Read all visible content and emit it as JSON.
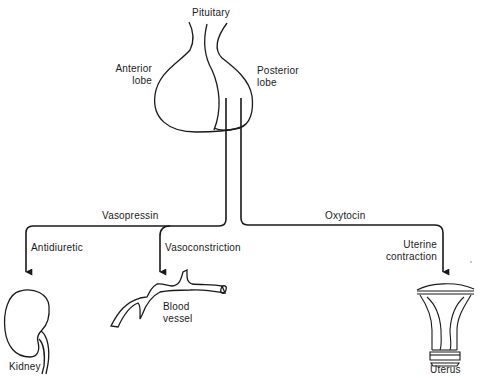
{
  "diagram": {
    "gland": {
      "title": "Pituitary",
      "anterior_label_line1": "Anterior",
      "anterior_label_line2": "lobe",
      "posterior_label_line1": "Posterior",
      "posterior_label_line2": "lobe"
    },
    "pathways": [
      {
        "hormone": "Vasopressin"
      },
      {
        "hormone": "Oxytocin"
      }
    ],
    "effects": {
      "antidiuretic": "Antidiuretic",
      "vasoconstriction": "Vasoconstriction",
      "uterine_line1": "Uterine",
      "uterine_line2": "contraction"
    },
    "targets": {
      "kidney": "Kidney",
      "blood_vessel_line1": "Blood",
      "blood_vessel_line2": "vessel",
      "uterus": "Uterus"
    },
    "colors": {
      "ink": "#1a1a1a",
      "background": "#ffffff"
    }
  }
}
